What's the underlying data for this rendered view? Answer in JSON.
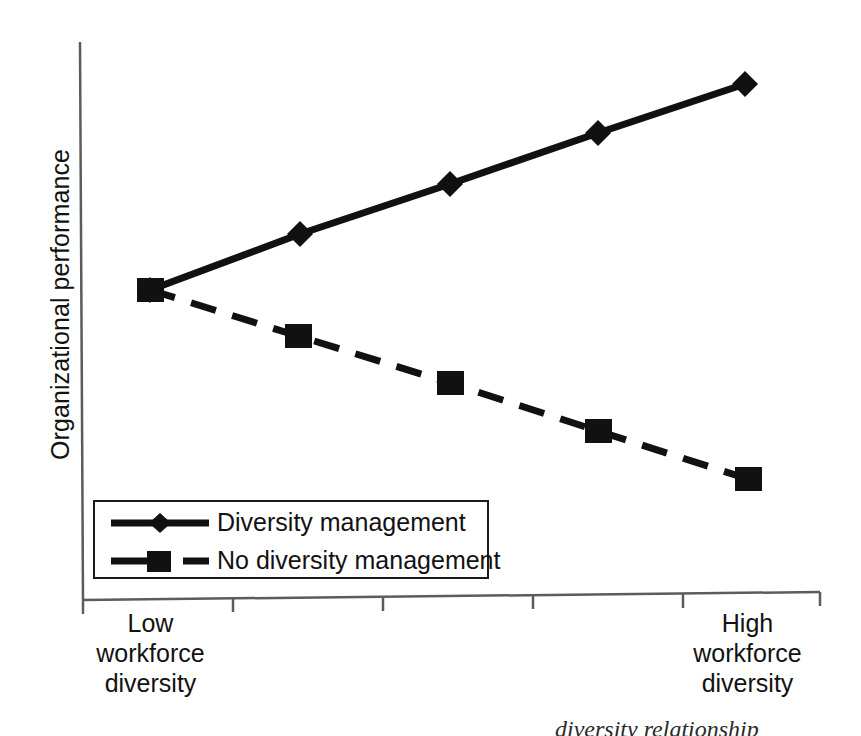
{
  "chart_data": {
    "type": "line",
    "title": "",
    "subtitle": "",
    "xlabel": "",
    "ylabel": "Organizational performance",
    "xlim": [
      0,
      5
    ],
    "ylim": [
      0,
      10
    ],
    "grid": false,
    "legend_position": "bottom-left",
    "x": [
      1,
      2,
      3,
      4,
      5
    ],
    "categories": [
      "1",
      "2",
      "3",
      "4",
      "5"
    ],
    "x_tick_labels": [
      "Low\nworkforce\ndiversity",
      "",
      "",
      "",
      "High\nworkforce\ndiversity"
    ],
    "x_tick_count": 5,
    "y_tick_labels": [],
    "series": [
      {
        "name": "Diversity management",
        "marker": "diamond",
        "linestyle": "solid",
        "color": "#111111",
        "values": [
          5.0,
          6.05,
          7.0,
          7.95,
          9.0
        ],
        "pixel_points": [
          [
            150,
            290
          ],
          [
            300,
            234
          ],
          [
            450,
            184
          ],
          [
            598,
            133
          ],
          [
            745,
            84
          ]
        ]
      },
      {
        "name": "No diversity management",
        "marker": "square",
        "linestyle": "dashed",
        "color": "#111111",
        "values": [
          5.0,
          4.15,
          3.3,
          2.45,
          1.6
        ],
        "pixel_points": [
          [
            150,
            290
          ],
          [
            298,
            336
          ],
          [
            450,
            383
          ],
          [
            598,
            431
          ],
          [
            748,
            479
          ]
        ]
      }
    ]
  },
  "axes": {
    "y_axis_title": "Organizational performance",
    "x_tick_low_label": "Low\nworkforce\ndiversity",
    "x_tick_high_label": "High\nworkforce\ndiversity"
  },
  "legend": {
    "entries": [
      {
        "label": "Diversity management",
        "marker": "diamond-marker",
        "line": "solid-line"
      },
      {
        "label": "No diversity management",
        "marker": "square-marker",
        "line": "dashed-line"
      }
    ]
  },
  "caption": {
    "text": "diversity relationship"
  },
  "colors": {
    "ink": "#111111",
    "axis": "#555555",
    "background": "#ffffff"
  }
}
